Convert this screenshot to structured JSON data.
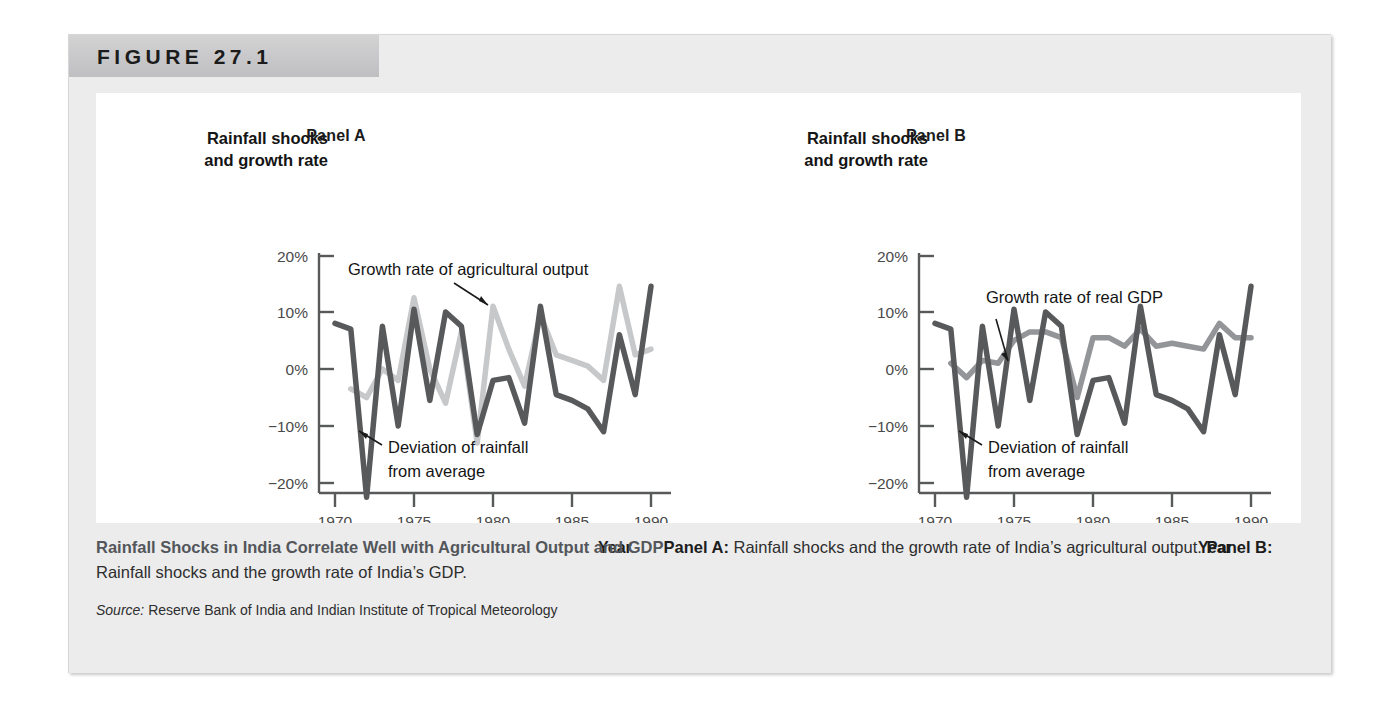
{
  "figure": {
    "number_label": "FIGURE 27.1"
  },
  "caption": {
    "headline": "Rainfall Shocks in India Correlate Well with Agricultural Output and GDP",
    "panel_a_tag": "Panel A:",
    "panel_a_text": " Rainfall shocks and the growth rate of India’s agricultural output. ",
    "panel_b_tag": "Panel B:",
    "panel_b_text": " Rainfall shocks and the growth rate of India’s GDP.",
    "source_label": "Source:",
    "source_text": " Reserve Bank of India and Indian Institute of Tropical Meteorology"
  },
  "colors": {
    "rainfall_line": "#58595b",
    "growth_line_a": "#c7c8ca",
    "growth_line_b": "#939598",
    "axis": "#58595b",
    "header_band": "#c8c8ca",
    "panel_background": "#ececed"
  },
  "chart_data": [
    {
      "type": "line",
      "panel_title": "Panel A",
      "title": "Rainfall shocks and growth rate",
      "ylabel_line1": "Rainfall shocks",
      "ylabel_line2": "and growth rate",
      "xlabel": "Year",
      "ylim": [
        -25,
        22
      ],
      "xlim": [
        1969,
        1991
      ],
      "yticks": [
        20,
        10,
        0,
        -10,
        -20
      ],
      "ytick_labels": [
        "20%",
        "10%",
        "0%",
        "−10%",
        "−20%"
      ],
      "xticks": [
        1970,
        1975,
        1980,
        1985,
        1990
      ],
      "xtick_labels": [
        "1970",
        "1975",
        "1980",
        "1985",
        "1990"
      ],
      "grid": false,
      "legend": "none",
      "annotations": [
        {
          "text": "Growth rate of agricultural output",
          "target_series": "Growth rate of agricultural output",
          "target_x": 1980,
          "target_y": 12.5
        },
        {
          "text_line1": "Deviation of rainfall",
          "text_line2": "from average",
          "target_series": "Deviation of rainfall from average",
          "target_x": 1972,
          "target_y": -15
        }
      ],
      "x": [
        1970,
        1971,
        1972,
        1973,
        1974,
        1975,
        1976,
        1977,
        1978,
        1979,
        1980,
        1981,
        1982,
        1983,
        1984,
        1985,
        1986,
        1987,
        1988,
        1989,
        1990
      ],
      "series": [
        {
          "name": "Deviation of rainfall from average",
          "color": "#58595b",
          "values": [
            8.0,
            7.0,
            -22.5,
            7.5,
            -10.0,
            10.5,
            -5.5,
            10.0,
            7.5,
            -11.5,
            -2.0,
            -1.5,
            -9.5,
            11.0,
            -4.5,
            -5.5,
            -7.0,
            -11.0,
            6.0,
            -4.5,
            14.5
          ]
        },
        {
          "name": "Growth rate of agricultural output",
          "color": "#c7c8ca",
          "values": [
            null,
            -3.5,
            -5.0,
            0.0,
            -2.0,
            12.5,
            0.0,
            -6.0,
            6.5,
            -13.0,
            11.0,
            3.5,
            -3.0,
            9.5,
            2.5,
            1.5,
            0.5,
            -2.0,
            14.5,
            2.5,
            3.5
          ]
        }
      ]
    },
    {
      "type": "line",
      "panel_title": "Panel B",
      "title": "Rainfall shocks and growth rate",
      "ylabel_line1": "Rainfall shocks",
      "ylabel_line2": "and growth rate",
      "xlabel": "Year",
      "ylim": [
        -25,
        22
      ],
      "xlim": [
        1969,
        1991
      ],
      "yticks": [
        20,
        10,
        0,
        -10,
        -20
      ],
      "ytick_labels": [
        "20%",
        "10%",
        "0%",
        "−10%",
        "−20%"
      ],
      "xticks": [
        1970,
        1975,
        1980,
        1985,
        1990
      ],
      "xtick_labels": [
        "1970",
        "1975",
        "1980",
        "1985",
        "1990"
      ],
      "grid": false,
      "legend": "none",
      "annotations": [
        {
          "text": "Growth rate of real GDP",
          "target_series": "Growth rate of real GDP",
          "target_x": 1974,
          "target_y": 2.0
        },
        {
          "text_line1": "Deviation of rainfall",
          "text_line2": "from average",
          "target_series": "Deviation of rainfall from average",
          "target_x": 1972,
          "target_y": -15
        }
      ],
      "x": [
        1970,
        1971,
        1972,
        1973,
        1974,
        1975,
        1976,
        1977,
        1978,
        1979,
        1980,
        1981,
        1982,
        1983,
        1984,
        1985,
        1986,
        1987,
        1988,
        1989,
        1990
      ],
      "series": [
        {
          "name": "Deviation of rainfall from average",
          "color": "#58595b",
          "values": [
            8.0,
            7.0,
            -22.5,
            7.5,
            -10.0,
            10.5,
            -5.5,
            10.0,
            7.5,
            -11.5,
            -2.0,
            -1.5,
            -9.5,
            11.0,
            -4.5,
            -5.5,
            -7.0,
            -11.0,
            6.0,
            -4.5,
            14.5
          ]
        },
        {
          "name": "Growth rate of real GDP",
          "color": "#939598",
          "values": [
            null,
            1.0,
            -1.5,
            1.5,
            1.0,
            5.0,
            6.5,
            6.5,
            5.5,
            -5.0,
            5.5,
            5.5,
            4.0,
            7.0,
            4.0,
            4.5,
            4.0,
            3.5,
            8.0,
            5.5,
            5.5
          ]
        }
      ]
    }
  ]
}
